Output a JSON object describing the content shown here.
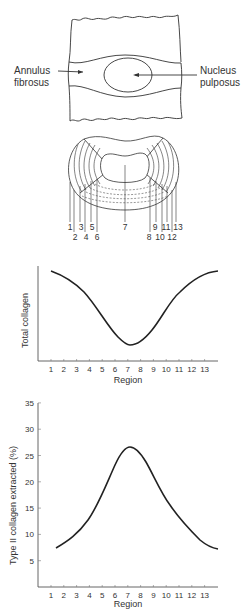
{
  "anatomy": {
    "annulus_label_line1": "Annulus",
    "annulus_label_line2": "fibrosus",
    "nucleus_label_line1": "Nucleus",
    "nucleus_label_line2": "pulposus"
  },
  "cross_section": {
    "region_labels_top": [
      "1",
      "3",
      "5",
      "7",
      "9",
      "11",
      "13"
    ],
    "region_labels_bottom": [
      "2",
      "4",
      "6",
      "8",
      "10",
      "12"
    ]
  },
  "chart_data": [
    {
      "type": "line",
      "title": "",
      "xlabel": "Region",
      "ylabel": "Total collagen",
      "categories": [
        "1",
        "2",
        "3",
        "4",
        "5",
        "6",
        "7",
        "8",
        "9",
        "10",
        "11",
        "12",
        "13"
      ],
      "x": [
        1,
        2,
        3,
        4,
        5,
        6,
        7,
        8,
        9,
        10,
        11,
        12,
        13
      ],
      "values": [
        95,
        88,
        78,
        62,
        42,
        24,
        15,
        24,
        44,
        66,
        82,
        92,
        97
      ],
      "y_ticks_shown": false,
      "grid": false,
      "legend": null
    },
    {
      "type": "line",
      "title": "",
      "xlabel": "Region",
      "ylabel": "Type II collagen extracted (%)",
      "categories": [
        "1",
        "2",
        "3",
        "4",
        "5",
        "6",
        "7",
        "8",
        "9",
        "10",
        "11",
        "12",
        "13"
      ],
      "x": [
        1,
        2,
        3,
        4,
        5,
        6,
        7,
        8,
        9,
        10,
        11,
        12,
        13
      ],
      "values": [
        7.5,
        9,
        11.5,
        15,
        20,
        25,
        26.5,
        24,
        19,
        14,
        10.5,
        8,
        6.5
      ],
      "ylim": [
        0,
        35
      ],
      "y_ticks": [
        5,
        10,
        15,
        20,
        25,
        30,
        35
      ],
      "grid": false,
      "legend": null
    }
  ],
  "chart1": {
    "ylabel": "Total collagen",
    "xlabel": "Region",
    "x_ticks": [
      "1",
      "2",
      "3",
      "4",
      "5",
      "6",
      "7",
      "8",
      "9",
      "10",
      "11",
      "12",
      "13"
    ]
  },
  "chart2": {
    "ylabel": "Type II collagen extracted (%)",
    "xlabel": "Region",
    "x_ticks": [
      "1",
      "2",
      "3",
      "4",
      "5",
      "6",
      "7",
      "8",
      "9",
      "10",
      "11",
      "12",
      "13"
    ],
    "y_ticks": [
      "35",
      "30",
      "25",
      "20",
      "15",
      "10",
      "5"
    ]
  }
}
